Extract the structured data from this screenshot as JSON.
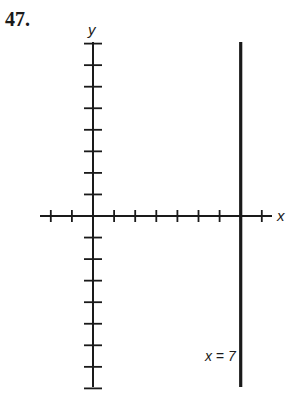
{
  "problem": {
    "number": "47."
  },
  "chart_data": {
    "type": "line",
    "title": "",
    "xlabel": "x",
    "ylabel": "y",
    "x_range": [
      -2,
      8
    ],
    "y_range": [
      -8,
      8
    ],
    "x_ticks": [
      -2,
      -1,
      0,
      1,
      2,
      3,
      4,
      5,
      6,
      7,
      8
    ],
    "y_ticks": [
      -8,
      -7,
      -6,
      -5,
      -4,
      -3,
      -2,
      -1,
      0,
      1,
      2,
      3,
      4,
      5,
      6,
      7,
      8
    ],
    "tick_labels_shown": false,
    "grid": false,
    "series": [
      {
        "name": "x = 7",
        "kind": "vertical-line",
        "equation": "x = 7",
        "x": 7,
        "y_extent": [
          -8,
          8
        ]
      }
    ],
    "annotations": [
      {
        "text": "x = 7",
        "x": 7,
        "y": -6.6,
        "anchor": "left-of-line"
      }
    ]
  },
  "labels": {
    "x_axis": "x",
    "y_axis": "y",
    "line": "x = 7"
  },
  "style": {
    "ink_color": "#1a1a1a",
    "background": "#ffffff"
  }
}
